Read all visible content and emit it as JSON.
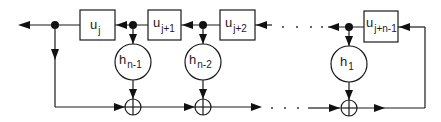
{
  "diagram": {
    "title": "",
    "registers": [
      {
        "id": "u_j",
        "base": "u",
        "subscript": "j"
      },
      {
        "id": "u_j+1",
        "base": "u",
        "subscript": "j+1"
      },
      {
        "id": "u_j+2",
        "base": "u",
        "subscript": "j+2"
      },
      {
        "id": "u_j+n-1",
        "base": "u",
        "subscript": "j+n-1"
      }
    ],
    "coefficients": [
      {
        "id": "h_n-1",
        "base": "h",
        "subscript": "n-1"
      },
      {
        "id": "h_n-2",
        "base": "h",
        "subscript": "n-2"
      },
      {
        "id": "h_1",
        "base": "h",
        "subscript": "1"
      }
    ],
    "adders": [
      {
        "id": "sum-1",
        "symbol": "plus"
      },
      {
        "id": "sum-2",
        "symbol": "plus"
      },
      {
        "id": "sum-3",
        "symbol": "plus"
      }
    ],
    "ellipsis": "· · ·"
  }
}
